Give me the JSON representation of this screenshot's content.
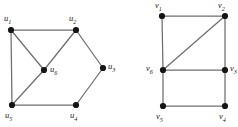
{
  "figure": {
    "background_color": "#ffffff",
    "edge_color": "#6e6e6e",
    "vertex_color": "#151515",
    "label_color": "#1a1a1a",
    "width": 238,
    "height": 127
  },
  "graphs": [
    {
      "id": "graph-left",
      "name": "u-graph",
      "vertices": [
        {
          "id": "u1",
          "base": "u",
          "index": "1",
          "x": 11,
          "y": 30,
          "label_x": 4,
          "label_y": 14
        },
        {
          "id": "u2",
          "base": "u",
          "index": "2",
          "x": 76,
          "y": 30,
          "label_x": 69,
          "label_y": 14
        },
        {
          "id": "u3",
          "base": "u",
          "index": "3",
          "x": 103,
          "y": 68,
          "label_x": 108,
          "label_y": 62
        },
        {
          "id": "u4",
          "base": "u",
          "index": "4",
          "x": 76,
          "y": 105,
          "label_x": 70,
          "label_y": 111
        },
        {
          "id": "u5",
          "base": "u",
          "index": "5",
          "x": 12,
          "y": 105,
          "label_x": 5,
          "label_y": 111
        },
        {
          "id": "u6",
          "base": "u",
          "index": "6",
          "x": 44,
          "y": 70,
          "label_x": 50,
          "label_y": 65
        }
      ],
      "edges": [
        {
          "from": "u1",
          "to": "u2"
        },
        {
          "from": "u1",
          "to": "u5"
        },
        {
          "from": "u1",
          "to": "u6"
        },
        {
          "from": "u2",
          "to": "u6"
        },
        {
          "from": "u2",
          "to": "u3"
        },
        {
          "from": "u3",
          "to": "u4"
        },
        {
          "from": "u4",
          "to": "u5"
        },
        {
          "from": "u5",
          "to": "u6"
        }
      ]
    },
    {
      "id": "graph-right",
      "name": "v-graph",
      "vertices": [
        {
          "id": "v1",
          "base": "v",
          "index": "1",
          "x": 43,
          "y": 16,
          "label_x": 36,
          "label_y": 1
        },
        {
          "id": "v2",
          "base": "v",
          "index": "2",
          "x": 106,
          "y": 16,
          "label_x": 99,
          "label_y": 1
        },
        {
          "id": "v3",
          "base": "v",
          "index": "3",
          "x": 106,
          "y": 70,
          "label_x": 111,
          "label_y": 64
        },
        {
          "id": "v4",
          "base": "v",
          "index": "4",
          "x": 106,
          "y": 106,
          "label_x": 100,
          "label_y": 112
        },
        {
          "id": "v5",
          "base": "v",
          "index": "5",
          "x": 44,
          "y": 106,
          "label_x": 37,
          "label_y": 112
        },
        {
          "id": "v6",
          "base": "v",
          "index": "6",
          "x": 44,
          "y": 70,
          "label_x": 27,
          "label_y": 64
        }
      ],
      "edges": [
        {
          "from": "v1",
          "to": "v2"
        },
        {
          "from": "v1",
          "to": "v6"
        },
        {
          "from": "v2",
          "to": "v3"
        },
        {
          "from": "v2",
          "to": "v6"
        },
        {
          "from": "v6",
          "to": "v3"
        },
        {
          "from": "v6",
          "to": "v5"
        },
        {
          "from": "v5",
          "to": "v4"
        },
        {
          "from": "v4",
          "to": "v3"
        }
      ]
    }
  ]
}
